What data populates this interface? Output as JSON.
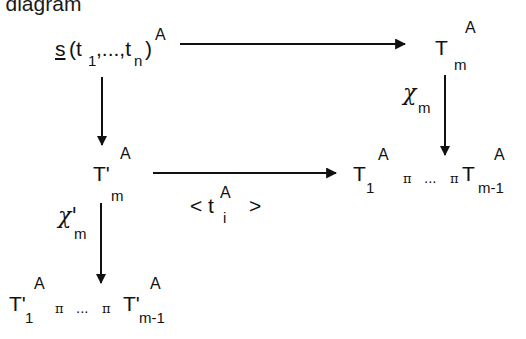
{
  "title": "e diagram",
  "nodes": {
    "top_left": {
      "symbol": "s",
      "open_paren": "(t",
      "sub1": "1",
      "mid": ",...,t",
      "subn": "n",
      "close_paren": ")",
      "sup": "A"
    },
    "top_right": {
      "base": "T",
      "sub": "m",
      "sup": "A"
    },
    "mid_left": {
      "base": "T'",
      "sub": "m",
      "sup": "A"
    },
    "mid_right": {
      "first_base": "T",
      "first_sub": "1",
      "first_sup": "A",
      "op1": "π",
      "ellipsis": "...",
      "op2": "π",
      "last_base": "T",
      "last_sub": "m-1",
      "last_sup": "A"
    },
    "bottom_left": {
      "first_base": "T'",
      "first_sub": "1",
      "first_sup": "A",
      "op1": "π",
      "ellipsis": "...",
      "op2": "π",
      "last_base": "T'",
      "last_sub": "m-1",
      "last_sup": "A"
    }
  },
  "labels": {
    "chi_m": {
      "base": "χ",
      "sub": "m"
    },
    "chi_prime_m": {
      "base": "χ'",
      "sub": "m"
    },
    "tuple": {
      "open": "< t",
      "sup": "A",
      "sub": "i",
      "close": ">"
    }
  },
  "arrows": [
    {
      "from": "top_left",
      "to": "top_right",
      "label": ""
    },
    {
      "from": "top_left",
      "to": "mid_left",
      "label": ""
    },
    {
      "from": "top_right",
      "to": "mid_right",
      "label": "chi_m"
    },
    {
      "from": "mid_left",
      "to": "mid_right",
      "label": "tuple"
    },
    {
      "from": "mid_left",
      "to": "bottom_left",
      "label": "chi_prime_m"
    }
  ],
  "colors": {
    "ink": "#111111",
    "background": "#ffffff"
  }
}
